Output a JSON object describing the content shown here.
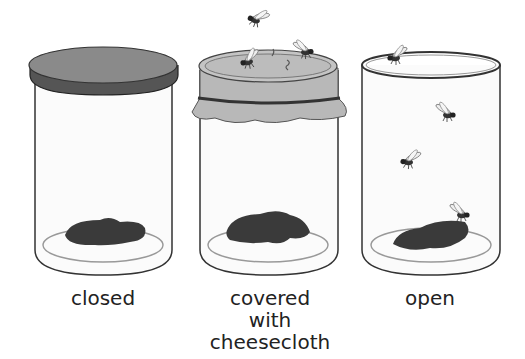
{
  "diagram": {
    "jars": [
      {
        "id": "closed",
        "label_lines": [
          "closed"
        ],
        "cover": "lid",
        "flies": 0
      },
      {
        "id": "cheesecloth",
        "label_lines": [
          "covered",
          "with",
          "cheesecloth"
        ],
        "cover": "cheesecloth",
        "flies": 3
      },
      {
        "id": "open",
        "label_lines": [
          "open"
        ],
        "cover": "none",
        "flies": 4
      }
    ],
    "colors": {
      "lid": "#6e6e6e",
      "lid_top": "#8a8a8a",
      "cloth": "#b8b8b8",
      "meat": "#3a3a3a",
      "jar_outline": "#333333",
      "dish": "#999999",
      "background": "#ffffff"
    }
  }
}
